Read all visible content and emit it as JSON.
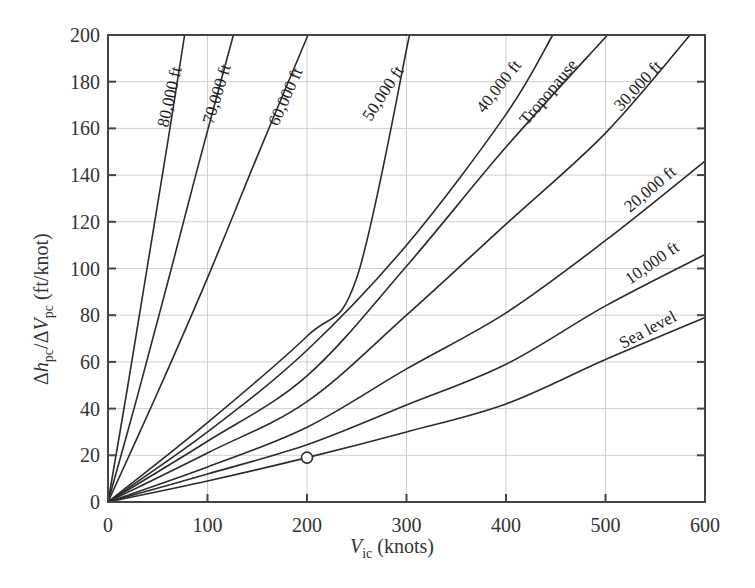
{
  "chart_data": {
    "type": "line",
    "title": "",
    "xlabel": "V_ic (knots)",
    "xlabel_main": "V",
    "xlabel_sub": "ic",
    "xlabel_unit": " (knots)",
    "ylabel": "Δh_pc/ΔV_pc (ft/knot)",
    "ylabel_parts": {
      "delta1": "Δ",
      "h": "h",
      "h_sub": "pc",
      "slash": "/Δ",
      "v": "V",
      "v_sub": "pc",
      "unit": " (ft/knot)"
    },
    "xlim": [
      0,
      600
    ],
    "ylim": [
      0,
      200
    ],
    "xticks": [
      0,
      100,
      200,
      300,
      400,
      500,
      600
    ],
    "yticks": [
      0,
      20,
      40,
      60,
      80,
      100,
      120,
      140,
      160,
      180,
      200
    ],
    "grid": true,
    "legend": "inline labels on curves",
    "series": [
      {
        "name": "80,000 ft",
        "points": [
          [
            0,
            0
          ],
          [
            20,
            50
          ],
          [
            40,
            102
          ],
          [
            60,
            154
          ],
          [
            77,
            200
          ]
        ]
      },
      {
        "name": "70,000 ft",
        "points": [
          [
            0,
            0
          ],
          [
            30,
            46
          ],
          [
            60,
            94
          ],
          [
            90,
            143
          ],
          [
            126,
            200
          ]
        ]
      },
      {
        "name": "60,000 ft",
        "points": [
          [
            0,
            0
          ],
          [
            50,
            47
          ],
          [
            100,
            96
          ],
          [
            150,
            148
          ],
          [
            201,
            200
          ]
        ]
      },
      {
        "name": "50,000 ft",
        "points": [
          [
            0,
            0
          ],
          [
            100,
            34
          ],
          [
            200,
            71
          ],
          [
            250,
            96
          ],
          [
            303,
            200
          ]
        ]
      },
      {
        "name": "40,000 ft",
        "points": [
          [
            0,
            0
          ],
          [
            100,
            30
          ],
          [
            200,
            65
          ],
          [
            300,
            110
          ],
          [
            400,
            166
          ],
          [
            447,
            200
          ]
        ]
      },
      {
        "name": "Tropopause",
        "points": [
          [
            0,
            0
          ],
          [
            100,
            26
          ],
          [
            200,
            54
          ],
          [
            300,
            101
          ],
          [
            400,
            152
          ],
          [
            502,
            200
          ]
        ]
      },
      {
        "name": "30,000 ft",
        "points": [
          [
            0,
            0
          ],
          [
            100,
            21
          ],
          [
            200,
            43
          ],
          [
            300,
            80
          ],
          [
            400,
            119
          ],
          [
            500,
            158
          ],
          [
            585,
            200
          ]
        ]
      },
      {
        "name": "20,000 ft",
        "points": [
          [
            0,
            0
          ],
          [
            100,
            15
          ],
          [
            200,
            32
          ],
          [
            300,
            57
          ],
          [
            400,
            81
          ],
          [
            500,
            112
          ],
          [
            600,
            146
          ]
        ]
      },
      {
        "name": "10,000 ft",
        "points": [
          [
            0,
            0
          ],
          [
            100,
            12
          ],
          [
            200,
            24.5
          ],
          [
            300,
            41.5
          ],
          [
            400,
            59
          ],
          [
            500,
            84
          ],
          [
            600,
            106
          ]
        ]
      },
      {
        "name": "Sea level",
        "points": [
          [
            0,
            0
          ],
          [
            100,
            9
          ],
          [
            200,
            19
          ],
          [
            300,
            30
          ],
          [
            400,
            42
          ],
          [
            500,
            61
          ],
          [
            600,
            79
          ]
        ]
      }
    ],
    "annotations": [
      {
        "type": "circle-marker",
        "x": 200,
        "y": 19,
        "series": "Sea level"
      }
    ]
  },
  "labels": {
    "curve_80k": "80,000 ft",
    "curve_70k": "70,000 ft",
    "curve_60k": "60,000 ft",
    "curve_50k": "50,000 ft",
    "curve_40k": "40,000 ft",
    "curve_trop": "Tropopause",
    "curve_30k": "30,000 ft",
    "curve_20k": "20,000 ft",
    "curve_10k": "10,000 ft",
    "curve_sl": "Sea level"
  }
}
